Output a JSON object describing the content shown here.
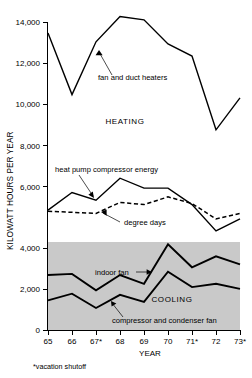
{
  "chart_data": {
    "type": "line",
    "title": "",
    "xlabel": "YEAR",
    "ylabel": "KILOWATT HOURS PER YEAR",
    "categories": [
      "65",
      "66",
      "67*",
      "68",
      "69",
      "70",
      "71*",
      "72",
      "73*"
    ],
    "x": [
      65,
      66,
      67,
      68,
      69,
      70,
      71,
      72,
      73
    ],
    "ylim": [
      0,
      14000
    ],
    "xlim": [
      65,
      73
    ],
    "ytick_labels": [
      "0",
      "2,000",
      "4,000",
      "6,000",
      "8,000",
      "10,000",
      "12,000",
      "14,000"
    ],
    "ytick_values": [
      0,
      2000,
      4000,
      6000,
      8000,
      10000,
      12000,
      14000
    ],
    "grid": false,
    "legend": "none",
    "footnote": "*vacation shutoff",
    "series": [
      {
        "name": "fan and duct heaters",
        "style": "solid",
        "values": [
          13500,
          10700,
          13100,
          14250,
          14100,
          13000,
          12450,
          9100,
          10550
        ]
      },
      {
        "name": "heat pump compressor energy",
        "style": "solid",
        "values": [
          5450,
          6250,
          5900,
          6900,
          6450,
          6450,
          5700,
          4500,
          5050
        ]
      },
      {
        "name": "degree days",
        "style": "dashed",
        "values": [
          5400,
          5350,
          5300,
          5800,
          5700,
          6050,
          5750,
          5050,
          5300
        ]
      },
      {
        "name": "indoor fan",
        "style": "solid-thick",
        "values": [
          2500,
          2550,
          1800,
          2500,
          2100,
          3900,
          2850,
          3350,
          2980
        ]
      },
      {
        "name": "compressor and condenser fan",
        "style": "solid-thick",
        "values": [
          1350,
          1650,
          1000,
          1600,
          1280,
          2650,
          1950,
          2100,
          1870
        ]
      }
    ],
    "annotations": [
      {
        "text": "fan and duct heaters",
        "target_series": "fan and duct heaters"
      },
      {
        "text": "heat pump compressor energy",
        "target_series": "heat pump compressor energy"
      },
      {
        "text": "degree days",
        "target_series": "degree days"
      },
      {
        "text": "indoor fan",
        "target_series": "indoor fan"
      },
      {
        "text": "compressor and condenser fan",
        "target_series": "compressor and condenser fan"
      },
      {
        "text": "HEATING",
        "type": "region-label"
      },
      {
        "text": "COOLING",
        "type": "region-label"
      }
    ],
    "shaded_band": {
      "from": 0,
      "to": 4000,
      "color": "#c9c9c9",
      "label": "COOLING"
    }
  },
  "axis": {
    "y_title": "KILOWATT HOURS PER YEAR",
    "x_title": "YEAR",
    "y_ticks": [
      {
        "label": "14,000"
      },
      {
        "label": "12,000"
      },
      {
        "label": "10,000"
      },
      {
        "label": "8,000"
      },
      {
        "label": "6,000"
      },
      {
        "label": "4,000"
      },
      {
        "label": "2,000"
      },
      {
        "label": "0"
      }
    ],
    "x_ticks": [
      {
        "label": "65"
      },
      {
        "label": "66"
      },
      {
        "label": "67*"
      },
      {
        "label": "68"
      },
      {
        "label": "69"
      },
      {
        "label": "70"
      },
      {
        "label": "71*"
      },
      {
        "label": "72"
      },
      {
        "label": "73*"
      }
    ]
  },
  "labels": {
    "heating_region": "HEATING",
    "cooling_region": "COOLING",
    "fan_and_duct_heaters": "fan and duct heaters",
    "heat_pump_compressor_energy": "heat pump compressor energy",
    "degree_days": "degree days",
    "indoor_fan": "indoor fan",
    "compressor_and_condenser_fan": "compressor and condenser fan",
    "footnote": "*vacation shutoff"
  },
  "colors": {
    "line": "#000000",
    "band": "#c9c9c9",
    "background": "#ffffff"
  }
}
